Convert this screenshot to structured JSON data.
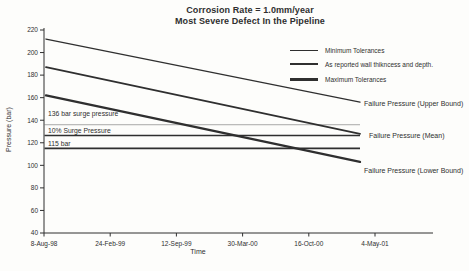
{
  "colors": {
    "ink": "#2f2f2f",
    "reference_line_light": "#9e9e9e",
    "background": "#fdfdfb"
  },
  "chart_data": {
    "type": "line",
    "title": "Corrosion Rate = 1.0mm/year",
    "subtitle": "Most Severe Defect In the Pipeline",
    "xlabel": "Time",
    "ylabel": "Pressure (bar)",
    "ylim": [
      40,
      220
    ],
    "yticks": [
      220,
      200,
      180,
      160,
      140,
      120,
      100,
      80,
      60,
      40
    ],
    "xticks": [
      "8-Aug-98",
      "24-Feb-99",
      "12-Sep-99",
      "30-Mar-00",
      "16-Oct-00",
      "4-May-01"
    ],
    "grid": "off",
    "legend_position": "top-right",
    "series": [
      {
        "name": "Failure Pressure (Upper Bound)",
        "legend": "Minimum Tolerances",
        "values": [
          212,
          156
        ]
      },
      {
        "name": "Failure Pressure (Mean)",
        "legend": "As reported wall thikncess and depth.",
        "values": [
          187,
          128
        ]
      },
      {
        "name": "Failure Pressure (Lower Bound)",
        "legend": "Maximum Tolerances",
        "values": [
          162,
          103
        ]
      }
    ],
    "reference_lines": [
      {
        "label": "136 bar surge pressure",
        "value": 136,
        "style": "thin-light"
      },
      {
        "label": "10%  Surge Pressure",
        "value": 126.5,
        "style": "dark"
      },
      {
        "label": "115 bar",
        "value": 115,
        "style": "dark"
      }
    ]
  }
}
